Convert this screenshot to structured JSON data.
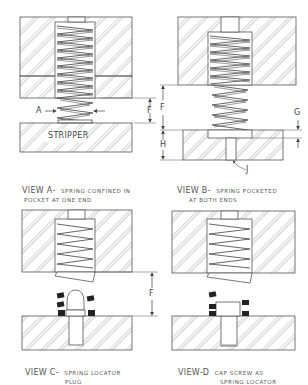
{
  "views": [
    {
      "id": "A",
      "title_prefix": "VIEW A-",
      "title_main": "SPRING CONFINED IN",
      "title_line2": "POCKET AT ONE END",
      "part_labels": {
        "stripper": "STRIPPER"
      },
      "dimensions": [
        "A",
        "F"
      ]
    },
    {
      "id": "B",
      "title_prefix": "VIEW B-",
      "title_main": "SPRING POCKETED",
      "title_line2": "AT BOTH ENDS",
      "dimensions": [
        "F",
        "G",
        "H",
        "J"
      ]
    },
    {
      "id": "C",
      "title_prefix": "VIEW C-",
      "title_main": "SPRING LOCATOR",
      "title_line2": "PLUG",
      "dimensions": [
        "F"
      ]
    },
    {
      "id": "D",
      "title_prefix": "VIEW-D",
      "title_main": "CAP SCREW AS",
      "title_line2": "SPRING LOCATOR",
      "dimensions": []
    }
  ],
  "colors": {
    "line": "#555555",
    "hatch": "#888888",
    "fill_black": "#222222",
    "background": "#ffffff"
  }
}
